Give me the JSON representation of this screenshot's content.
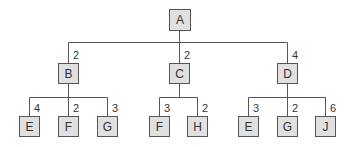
{
  "diagram": {
    "type": "tree",
    "line_color": "#555555",
    "node_fill": "#e0e0e0",
    "root": {
      "id": "A",
      "label": "A",
      "x": 179,
      "y": 19
    },
    "level1": [
      {
        "id": "B",
        "label": "B",
        "weight": "2",
        "x": 68,
        "y": 73
      },
      {
        "id": "C",
        "label": "C",
        "weight": "2",
        "x": 179,
        "y": 73
      },
      {
        "id": "D",
        "label": "D",
        "weight": "4",
        "x": 287,
        "y": 73
      }
    ],
    "level2": [
      {
        "id": "B-E",
        "parent": "B",
        "label": "E",
        "weight": "4",
        "x": 29,
        "y": 126
      },
      {
        "id": "B-F",
        "parent": "B",
        "label": "F",
        "weight": "2",
        "x": 68,
        "y": 126
      },
      {
        "id": "B-G",
        "parent": "B",
        "label": "G",
        "weight": "3",
        "x": 107,
        "y": 126
      },
      {
        "id": "C-F",
        "parent": "C",
        "label": "F",
        "weight": "3",
        "x": 159,
        "y": 126
      },
      {
        "id": "C-H",
        "parent": "C",
        "label": "H",
        "weight": "2",
        "x": 197,
        "y": 126
      },
      {
        "id": "D-E",
        "parent": "D",
        "label": "E",
        "weight": "3",
        "x": 248,
        "y": 126
      },
      {
        "id": "D-G",
        "parent": "D",
        "label": "G",
        "weight": "2",
        "x": 287,
        "y": 126
      },
      {
        "id": "D-J",
        "parent": "D",
        "label": "J",
        "weight": "6",
        "x": 325,
        "y": 126
      }
    ]
  }
}
